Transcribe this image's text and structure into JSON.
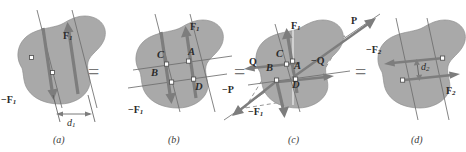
{
  "figure": {
    "background_color": "#ffffff",
    "body_fill_color": "#a9a9a9",
    "arrow_color": "#7d7d7d",
    "line_color": "#6e6e6e",
    "dashed_color": "#8b8b8b"
  },
  "equals_signs": {
    "sign": "=",
    "count": 3
  },
  "panels": [
    {
      "id": "a",
      "caption": "(a)",
      "labels": {
        "force_positive": "F",
        "force_positive_sub": "1",
        "force_negative": "−F",
        "force_negative_sub": "1",
        "distance": "d",
        "distance_sub": "1"
      }
    },
    {
      "id": "b",
      "caption": "(b)",
      "labels": {
        "force_positive": "F",
        "force_positive_sub": "1",
        "force_negative": "−F",
        "force_negative_sub": "1",
        "point_a": "A",
        "point_b": "B",
        "point_c": "C",
        "point_d": "D"
      }
    },
    {
      "id": "c",
      "caption": "(c)",
      "labels": {
        "force_positive": "F",
        "force_positive_sub": "1",
        "force_negative": "−F",
        "force_negative_sub": "1",
        "point_a": "A",
        "point_b": "B",
        "point_c": "C",
        "point_d": "D",
        "resultant_p": "P",
        "resultant_p_negative": "−P",
        "component_q": "Q",
        "component_q_negative": "−Q"
      }
    },
    {
      "id": "d",
      "caption": "(d)",
      "labels": {
        "force_positive": "F",
        "force_positive_sub": "2",
        "force_negative": "−F",
        "force_negative_sub": "2",
        "distance": "d",
        "distance_sub": "2"
      }
    }
  ]
}
